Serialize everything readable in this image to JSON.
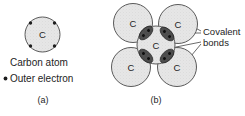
{
  "figure": {
    "background_color": "#ffffff",
    "width": 245,
    "height": 116,
    "colors": {
      "atom_fill": "#e3e3e3",
      "atom_stroke": "#555555",
      "bond_fill": "#4a4a4a",
      "electron_dot": "#1d1d1d",
      "text": "#1d1d1d",
      "leader_line": "#3a3a3a"
    },
    "panels": [
      {
        "id": "a",
        "label": "(a)",
        "atom_symbol": "C",
        "captions": [
          "Carbon atom",
          "Outer electron"
        ],
        "legend_bullet_label": "Outer electron",
        "atom_label": "Carbon atom",
        "electron_count": 4
      },
      {
        "id": "b",
        "label": "(b)",
        "atom_symbol": "C",
        "atom_count": 5,
        "bond_count": 4,
        "annotation": {
          "line1": "Covalent",
          "line2": "bonds",
          "full": "Covalent bonds"
        }
      }
    ]
  }
}
